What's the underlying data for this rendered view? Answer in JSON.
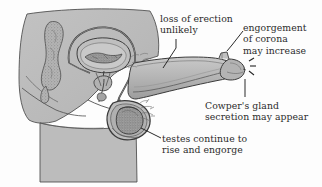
{
  "figure": {
    "kind": "anatomical-diagram",
    "palette": {
      "background": "#fdfdfd",
      "body_fill": "#b9b9b9",
      "body_fill_light": "#c6c6c6",
      "organ_fill": "#a8a8a8",
      "organ_fill_dark": "#8f8f8f",
      "stipple": "#7a7a7a",
      "outline": "#3a3a3a",
      "outline_soft": "#555555",
      "text": "#2b2b2b",
      "leader": "#1f1f1f"
    },
    "parts": [
      "sacrum-coccyx",
      "bladder",
      "prostate",
      "urethra",
      "vas-deferens",
      "penis-shaft",
      "corona",
      "glans",
      "scrotum",
      "testis",
      "thigh",
      "buttock",
      "abdomen"
    ]
  },
  "annotations": [
    {
      "id": "loss-erection",
      "lines": [
        "loss of erection",
        "unlikely"
      ]
    },
    {
      "id": "engorgement-corona",
      "lines": [
        "engorgement",
        "of corona",
        "may increase"
      ]
    },
    {
      "id": "cowpers-gland",
      "lines": [
        "Cowper's gland",
        "secretion may appear"
      ]
    },
    {
      "id": "testes-engorge",
      "lines": [
        "testes continue to",
        "rise and engorge"
      ]
    }
  ]
}
